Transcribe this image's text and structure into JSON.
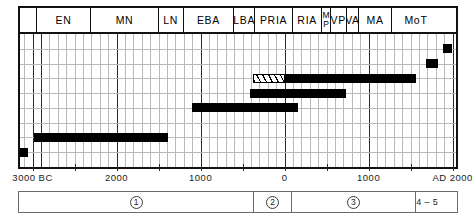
{
  "chart_data": {
    "type": "bar",
    "title": "",
    "subtitle": "",
    "xlabel": "",
    "ylabel": "",
    "orientation": "horizontal-timeline",
    "grid": true,
    "legend_position": "none",
    "x_axis": {
      "unit": "years",
      "range": [
        -3000,
        2000
      ],
      "tick_values": [
        -3000,
        -2500,
        -2000,
        -1500,
        -1000,
        -500,
        0,
        500,
        1000,
        1500,
        2000
      ],
      "labeled_ticks": [
        {
          "value": -3000,
          "label": "3000 BC"
        },
        {
          "value": -2000,
          "label": "2000"
        },
        {
          "value": -1000,
          "label": "1000"
        },
        {
          "value": 0,
          "label": "0"
        },
        {
          "value": 1000,
          "label": "1000"
        },
        {
          "value": 2000,
          "label": "AD 2000"
        }
      ],
      "minor_tick_step": 100,
      "major_gridline_values": [
        -3000,
        -2900,
        -2000,
        -1000,
        0,
        1000,
        2000
      ]
    },
    "period_headers": [
      {
        "label": "",
        "start": -3100,
        "end": -2900,
        "name": "blank"
      },
      {
        "label": "EN",
        "start": -2900,
        "end": -2250
      },
      {
        "label": "MN",
        "start": -2250,
        "end": -1450
      },
      {
        "label": "LN",
        "start": -1450,
        "end": -1150
      },
      {
        "label": "EBA",
        "start": -1150,
        "end": -550
      },
      {
        "label": "LBA",
        "start": -550,
        "end": -300
      },
      {
        "label": "PRIA",
        "start": -300,
        "end": 150
      },
      {
        "label": "RIA",
        "start": 150,
        "end": 500
      },
      {
        "label": "MP",
        "start": 500,
        "end": 600,
        "stacked": true
      },
      {
        "label": "VP",
        "start": 600,
        "end": 790
      },
      {
        "label": "VA",
        "start": 790,
        "end": 940
      },
      {
        "label": "MA",
        "start": 940,
        "end": 1330
      },
      {
        "label": "MoT",
        "start": 1330,
        "end": 1900
      }
    ],
    "series": [
      {
        "name": "bar-1",
        "style": "solid",
        "start": -3150,
        "end": -3050,
        "row": 8,
        "color": "#000000"
      },
      {
        "name": "bar-2",
        "style": "solid",
        "start": -2980,
        "end": -1390,
        "row": 7,
        "color": "#000000"
      },
      {
        "name": "bar-3",
        "style": "solid",
        "start": -1100,
        "end": 160,
        "row": 5,
        "color": "#000000"
      },
      {
        "name": "bar-4",
        "style": "hatched",
        "start": -380,
        "end": 0,
        "row": 3,
        "color": "#000000"
      },
      {
        "name": "bar-5",
        "style": "solid",
        "start": 0,
        "end": 1560,
        "row": 3,
        "color": "#000000"
      },
      {
        "name": "bar-6",
        "style": "solid",
        "start": -410,
        "end": 730,
        "row": 4,
        "color": "#000000"
      },
      {
        "name": "bar-7",
        "style": "solid",
        "start": 1680,
        "end": 1830,
        "row": 2,
        "color": "#000000"
      },
      {
        "name": "bar-8",
        "style": "solid",
        "start": 1880,
        "end": 1990,
        "row": 1,
        "color": "#000000"
      }
    ],
    "phase_bands": [
      {
        "label": "1",
        "circled": true,
        "start": -3100,
        "end": -300
      },
      {
        "label": "2",
        "circled": true,
        "start": -300,
        "end": 150
      },
      {
        "label": "3",
        "circled": true,
        "start": 150,
        "end": 1620
      },
      {
        "label": "4-5",
        "circled": false,
        "start": 1620,
        "end": 1900
      }
    ]
  }
}
